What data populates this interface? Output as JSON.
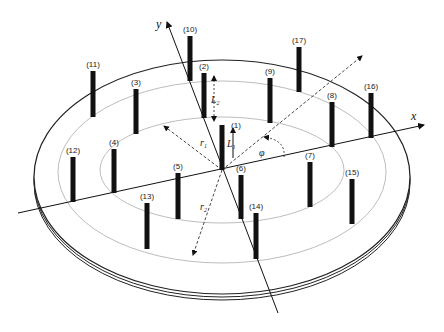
{
  "axes": {
    "x_label": "x",
    "y_label": "y"
  },
  "symbols": {
    "r1": {
      "base": "r",
      "sub": "1"
    },
    "r2": {
      "base": "r",
      "sub": "2"
    },
    "L1": {
      "base": "L",
      "sub": "1"
    },
    "L2": {
      "base": "L",
      "sub": "2"
    },
    "phi": "φ"
  },
  "rods": [
    {
      "id": "1",
      "label": "(1)",
      "ring": "center"
    },
    {
      "id": "2",
      "label": "(2)",
      "ring": "inner"
    },
    {
      "id": "3",
      "label": "(3)",
      "ring": "inner"
    },
    {
      "id": "4",
      "label": "(4)",
      "ring": "inner"
    },
    {
      "id": "5",
      "label": "(5)",
      "ring": "inner"
    },
    {
      "id": "6",
      "label": "(6)",
      "ring": "inner"
    },
    {
      "id": "7",
      "label": "(7)",
      "ring": "inner"
    },
    {
      "id": "8",
      "label": "(8)",
      "ring": "inner"
    },
    {
      "id": "9",
      "label": "(9)",
      "ring": "inner"
    },
    {
      "id": "10",
      "label": "(10)",
      "ring": "outer"
    },
    {
      "id": "11",
      "label": "(11)",
      "ring": "outer"
    },
    {
      "id": "12",
      "label": "(12)",
      "ring": "outer"
    },
    {
      "id": "13",
      "label": "(13)",
      "ring": "outer"
    },
    {
      "id": "14",
      "label": "(14)",
      "ring": "outer"
    },
    {
      "id": "15",
      "label": "(15)",
      "ring": "outer"
    },
    {
      "id": "16",
      "label": "(16)",
      "ring": "outer"
    },
    {
      "id": "17",
      "label": "(17)",
      "ring": "outer"
    }
  ]
}
